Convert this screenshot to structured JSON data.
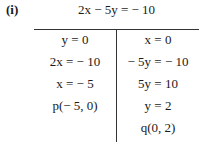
{
  "part_label": "(i)",
  "equation": "2x − 5y = − 10",
  "left_column": [
    "y = 0",
    "2x = − 10",
    "x = − 5",
    "p(− 5, 0)"
  ],
  "right_column": [
    "x = 0",
    "− 5y = − 10",
    "5y = 10",
    "y = 2",
    "q(0, 2)"
  ]
}
